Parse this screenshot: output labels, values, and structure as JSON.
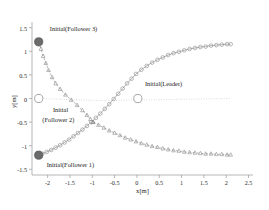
{
  "chart_data": {
    "type": "scatter",
    "title": "",
    "xlabel": "x[m]",
    "ylabel": "y[m]",
    "xlim": [
      -2.35,
      2.6
    ],
    "ylim": [
      -1.62,
      1.62
    ],
    "xticks": [
      "-2",
      "-1.5",
      "-1",
      "-0.5",
      "0",
      "0.5",
      "1",
      "1.5",
      "2",
      "2.5"
    ],
    "xtick_values": [
      -2,
      -1.5,
      -1,
      -0.5,
      0,
      0.5,
      1,
      1.5,
      2,
      2.5
    ],
    "yticks": [
      "1.5",
      "1",
      "0.5",
      "0",
      "-0.5",
      "-1",
      "-1.5"
    ],
    "ytick_values": [
      1.5,
      1,
      0.5,
      0,
      -0.5,
      -1,
      -1.5
    ],
    "grid": false,
    "legend": "none",
    "annotations": [
      {
        "text": "Initial(Follower 3)",
        "x": -1.95,
        "y": 1.47
      },
      {
        "text": "Initial(Leader)",
        "x": 0.18,
        "y": 0.3
      },
      {
        "text": "Initial",
        "x": -1.88,
        "y": -0.25
      },
      {
        "text": "(Follower 2)",
        "x": -2.12,
        "y": -0.46
      },
      {
        "text": "Initial(Follower 1)",
        "x": -2.02,
        "y": -1.4
      }
    ],
    "series": [
      {
        "name": "Leader",
        "marker": "circle-open",
        "color": "#8a8a8a",
        "linestyle": "solid",
        "points": [
          [
            -2.2,
            -1.2
          ],
          [
            -2.12,
            -1.17
          ],
          [
            -2.02,
            -1.13
          ],
          [
            -1.92,
            -1.09
          ],
          [
            -1.82,
            -1.04
          ],
          [
            -1.72,
            -0.99
          ],
          [
            -1.62,
            -0.93
          ],
          [
            -1.52,
            -0.87
          ],
          [
            -1.42,
            -0.8
          ],
          [
            -1.32,
            -0.73
          ],
          [
            -1.22,
            -0.66
          ],
          [
            -1.12,
            -0.58
          ],
          [
            -1.02,
            -0.5
          ],
          [
            -0.92,
            -0.41
          ],
          [
            -0.82,
            -0.32
          ],
          [
            -0.72,
            -0.22
          ],
          [
            -0.62,
            -0.12
          ],
          [
            -0.52,
            -0.01
          ],
          [
            -0.42,
            0.1
          ],
          [
            -0.32,
            0.21
          ],
          [
            -0.22,
            0.32
          ],
          [
            -0.12,
            0.42
          ],
          [
            -0.02,
            0.52
          ],
          [
            0.1,
            0.61
          ],
          [
            0.22,
            0.69
          ],
          [
            0.34,
            0.76
          ],
          [
            0.46,
            0.82
          ],
          [
            0.58,
            0.87
          ],
          [
            0.7,
            0.92
          ],
          [
            0.82,
            0.96
          ],
          [
            0.94,
            0.99
          ],
          [
            1.06,
            1.02
          ],
          [
            1.18,
            1.05
          ],
          [
            1.3,
            1.07
          ],
          [
            1.42,
            1.09
          ],
          [
            1.54,
            1.1
          ],
          [
            1.66,
            1.12
          ],
          [
            1.78,
            1.13
          ],
          [
            1.9,
            1.14
          ],
          [
            2.02,
            1.15
          ],
          [
            2.1,
            1.15
          ]
        ]
      },
      {
        "name": "Follower 3",
        "marker": "triangle-open",
        "color": "#8a8a8a",
        "linestyle": "dashed",
        "points": [
          [
            -2.2,
            1.2
          ],
          [
            -2.15,
            1.05
          ],
          [
            -2.1,
            0.9
          ],
          [
            -2.04,
            0.75
          ],
          [
            -1.98,
            0.6
          ],
          [
            -1.9,
            0.45
          ],
          [
            -1.82,
            0.32
          ],
          [
            -1.72,
            0.2
          ],
          [
            -1.6,
            0.08
          ],
          [
            -1.47,
            -0.03
          ],
          [
            -1.34,
            -0.14
          ],
          [
            -1.22,
            -0.25
          ],
          [
            -1.12,
            -0.35
          ],
          [
            -1.04,
            -0.44
          ],
          [
            -0.98,
            -0.5
          ]
        ]
      },
      {
        "name": "Follower 1",
        "marker": "triangle-open",
        "color": "#8a8a8a",
        "linestyle": "dashed",
        "points": [
          [
            -0.98,
            -0.5
          ],
          [
            -0.86,
            -0.56
          ],
          [
            -0.74,
            -0.62
          ],
          [
            -0.62,
            -0.68
          ],
          [
            -0.5,
            -0.73
          ],
          [
            -0.38,
            -0.78
          ],
          [
            -0.26,
            -0.83
          ],
          [
            -0.14,
            -0.87
          ],
          [
            -0.02,
            -0.91
          ],
          [
            0.1,
            -0.95
          ],
          [
            0.22,
            -0.98
          ],
          [
            0.34,
            -1.01
          ],
          [
            0.46,
            -1.03
          ],
          [
            0.58,
            -1.06
          ],
          [
            0.7,
            -1.08
          ],
          [
            0.82,
            -1.1
          ],
          [
            0.94,
            -1.11
          ],
          [
            1.06,
            -1.13
          ],
          [
            1.18,
            -1.14
          ],
          [
            1.3,
            -1.15
          ],
          [
            1.42,
            -1.16
          ],
          [
            1.54,
            -1.17
          ],
          [
            1.66,
            -1.17
          ],
          [
            1.78,
            -1.18
          ],
          [
            1.9,
            -1.18
          ],
          [
            2.02,
            -1.19
          ],
          [
            2.1,
            -1.19
          ]
        ]
      },
      {
        "name": "Leader reference path",
        "marker": "none",
        "color": "#c0b0b8",
        "linestyle": "dotted",
        "points": [
          [
            -2.2,
            0.0
          ],
          [
            -1.6,
            -0.02
          ],
          [
            -1.0,
            -0.04
          ],
          [
            -0.4,
            -0.04
          ],
          [
            0.2,
            -0.03
          ],
          [
            0.8,
            -0.02
          ],
          [
            1.4,
            -0.01
          ],
          [
            2.1,
            0.0
          ]
        ]
      }
    ],
    "initial_markers": [
      {
        "name": "Initial(Follower 3)",
        "x": -2.2,
        "y": 1.2,
        "style": "filled",
        "color": "#6b6b6b"
      },
      {
        "name": "Initial(Follower 2)",
        "x": -2.2,
        "y": 0.0,
        "style": "open",
        "color": "#9a9a9a"
      },
      {
        "name": "Initial(Follower 1)",
        "x": -2.2,
        "y": -1.2,
        "style": "filled",
        "color": "#6b6b6b"
      },
      {
        "name": "Initial(Leader)",
        "x": 0.02,
        "y": 0.0,
        "style": "open",
        "color": "#9a9a9a"
      }
    ]
  }
}
